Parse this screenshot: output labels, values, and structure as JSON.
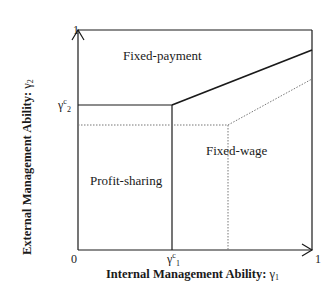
{
  "diagram": {
    "axes": {
      "x_label": "Internal Management Ability: ",
      "x_symbol": "γ",
      "x_symbol_sub": "1",
      "y_label": "External Management Ability: ",
      "y_symbol": "γ",
      "y_symbol_sub": "2",
      "origin_label": "0",
      "x_max_label": "1",
      "y_max_label": "1"
    },
    "thresholds": {
      "x_critical": {
        "symbol": "γ",
        "sup": "c",
        "sub": "1"
      },
      "y_critical": {
        "symbol": "γ",
        "sup": "c",
        "sub": "2"
      }
    },
    "regions": [
      {
        "id": "fixed-payment",
        "label": "Fixed-payment"
      },
      {
        "id": "fixed-wage",
        "label": "Fixed-wage"
      },
      {
        "id": "profit-sharing",
        "label": "Profit-sharing"
      }
    ],
    "colors": {
      "line": "#1a1a1a",
      "dotted": "#777777",
      "background": "#ffffff"
    }
  }
}
